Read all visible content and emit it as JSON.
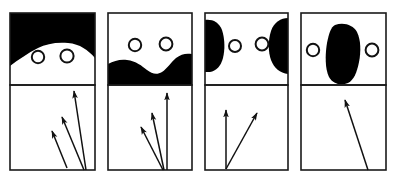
{
  "figure": {
    "title": "",
    "width": 393,
    "height": 177,
    "background_color": "#ffffff",
    "ink_color": "#000000",
    "stroke_color": "#1a1a1a",
    "panel_count": 4,
    "panels": [
      {
        "index": 1,
        "name": "panel-1",
        "frame": {
          "x": 10,
          "y": 13,
          "width": 85,
          "height": 157
        },
        "divider_y": 85,
        "upper": {
          "name": "upper-box-1",
          "shape_name": "black-cap-top-shape",
          "shape_description": "Solid black region filling the top of the box, its lower boundary a broad downward dome curve",
          "shape_path": "M10,13 L95,13 L95,58 C88,50 80,44 68,43 C56,42 46,44 38,48 C28,53 18,60 10,66 Z",
          "circles": [
            {
              "name": "circle-left",
              "cx": 38,
              "cy": 57,
              "r": 6.2
            },
            {
              "name": "circle-right",
              "cx": 67,
              "cy": 56,
              "r": 6.6
            }
          ]
        },
        "lower": {
          "name": "lower-box-1",
          "arrow_count": 3,
          "arrows": [
            {
              "name": "arrow-1",
              "x1": 86,
              "y1": 170,
              "x2": 74,
              "y2": 91,
              "head": 7
            },
            {
              "name": "arrow-2",
              "x1": 84,
              "y1": 170,
              "x2": 62,
              "y2": 117,
              "head": 7
            },
            {
              "name": "arrow-3",
              "x1": 67,
              "y1": 168,
              "x2": 52,
              "y2": 131,
              "head": 7
            }
          ]
        }
      },
      {
        "index": 2,
        "name": "panel-2",
        "frame": {
          "x": 108,
          "y": 13,
          "width": 84,
          "height": 157
        },
        "divider_y": 85,
        "upper": {
          "name": "upper-box-2",
          "shape_name": "black-valley-bottom-shape",
          "shape_description": "Solid black region filling the bottom of the box, its upper boundary a wavy edge that dips into a valley in the middle",
          "shape_path": "M108,64 C114,61 120,59 127,60 C136,61 142,66 147,70 C152,74 157,75 162,72 C167,69 171,62 176,58 C181,54 186,53 192,54 L192,85 L108,85 Z",
          "circles": [
            {
              "name": "circle-left",
              "cx": 135,
              "cy": 45,
              "r": 6.2
            },
            {
              "name": "circle-right",
              "cx": 166,
              "cy": 44,
              "r": 6.4
            }
          ]
        },
        "lower": {
          "name": "lower-box-2",
          "arrow_count": 3,
          "arrows": [
            {
              "name": "arrow-1",
              "x1": 167,
              "y1": 170,
              "x2": 167,
              "y2": 93,
              "head": 7
            },
            {
              "name": "arrow-2",
              "x1": 164,
              "y1": 170,
              "x2": 152,
              "y2": 113,
              "head": 7
            },
            {
              "name": "arrow-3",
              "x1": 163,
              "y1": 170,
              "x2": 141,
              "y2": 127,
              "head": 7
            }
          ]
        }
      },
      {
        "index": 3,
        "name": "panel-3",
        "frame": {
          "x": 205,
          "y": 13,
          "width": 83,
          "height": 157
        },
        "divider_y": 85,
        "upper": {
          "name": "upper-box-3",
          "shape_name": "black-side-blobs-shape",
          "shape_description": "Two solid black blobs hugging the left and right walls of the box with white space between them",
          "shape_paths": [
            "M205,20 C212,19 219,22 222,30 C225,39 225,50 223,58 C221,66 216,71 210,72 C208,72 206,72 205,72 Z",
            "M288,18 C281,18 274,22 271,31 C268,40 268,52 271,60 C274,68 280,73 288,74 Z"
          ],
          "circles": [
            {
              "name": "circle-left",
              "cx": 235,
              "cy": 46,
              "r": 6.0
            },
            {
              "name": "circle-right",
              "cx": 262,
              "cy": 44,
              "r": 6.4
            }
          ]
        },
        "lower": {
          "name": "lower-box-3",
          "arrow_count": 2,
          "arrows": [
            {
              "name": "arrow-1",
              "x1": 226,
              "y1": 169,
              "x2": 226,
              "y2": 110,
              "head": 7
            },
            {
              "name": "arrow-2",
              "x1": 226,
              "y1": 169,
              "x2": 257,
              "y2": 113,
              "head": 7
            }
          ]
        }
      },
      {
        "index": 4,
        "name": "panel-4",
        "frame": {
          "x": 301,
          "y": 13,
          "width": 85,
          "height": 157
        },
        "divider_y": 85,
        "upper": {
          "name": "upper-box-4",
          "shape_name": "black-central-blob-shape",
          "shape_description": "One solid black rounded vertical blob in the centre of the box, slightly tilted, reaching from near the top to near the divider",
          "shape_path": "M335,25 C344,22 353,25 357,32 C361,40 361,52 359,62 C357,72 354,80 348,83 C341,86 333,84 329,77 C325,69 325,55 327,43 C329,33 331,27 335,25 Z",
          "circles": [
            {
              "name": "circle-left",
              "cx": 313,
              "cy": 50,
              "r": 6.2
            },
            {
              "name": "circle-right",
              "cx": 372,
              "cy": 50,
              "r": 6.4
            }
          ]
        },
        "lower": {
          "name": "lower-box-4",
          "arrow_count": 1,
          "arrows": [
            {
              "name": "arrow-1",
              "x1": 368,
              "y1": 170,
              "x2": 345,
              "y2": 100,
              "head": 7
            }
          ]
        }
      }
    ]
  }
}
